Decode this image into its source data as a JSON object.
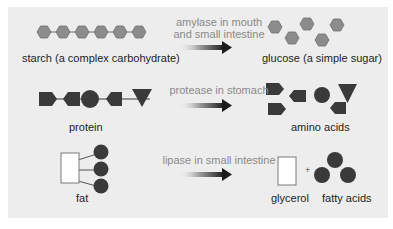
{
  "colors": {
    "panel_bg": "#ededed",
    "hexagon_fill": "#8c8c8c",
    "hexagon_stroke": "#6e6e6e",
    "dark_shape": "#3a3a3a",
    "enzyme_text": "#8a8a8a",
    "label_text": "#1e1e1e"
  },
  "rows": [
    {
      "id": "carbohydrate",
      "input_label": "starch (a complex carbohydrate)",
      "enzyme_line1": "amylase in mouth",
      "enzyme_line2": "and small intestine",
      "output_label": "glucose (a simple sugar)"
    },
    {
      "id": "protein",
      "input_label": "protein",
      "enzyme_line1": "protease in stomach",
      "output_label": "amino acids"
    },
    {
      "id": "fat",
      "input_label": "fat",
      "enzyme_line1": "lipase in small intestine",
      "output_label_1": "glycerol",
      "plus": "+",
      "output_label_2": "fatty acids"
    }
  ]
}
